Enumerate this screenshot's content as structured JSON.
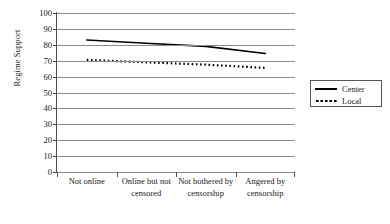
{
  "chart_data": {
    "type": "line",
    "title": "",
    "xlabel": "",
    "ylabel": "Regime Support",
    "ylim": [
      0,
      100
    ],
    "ytick_step": 10,
    "yticks": [
      "100",
      "90",
      "80",
      "70",
      "60",
      "50",
      "40",
      "30",
      "20",
      "10",
      "0"
    ],
    "grid": true,
    "legend_position": "right",
    "categories": [
      "Not online",
      "Online but not censored",
      "Not bothered by censorship",
      "Angered by censorship"
    ],
    "series": [
      {
        "name": "Center",
        "style": "solid",
        "color": "#000000",
        "values": [
          83,
          81,
          79,
          74.5
        ]
      },
      {
        "name": "Local",
        "style": "dotted",
        "color": "#000000",
        "values": [
          70.5,
          69,
          67.5,
          65.5
        ]
      }
    ]
  },
  "legend": {
    "items": [
      {
        "label": "Center",
        "style": "solid"
      },
      {
        "label": "Local",
        "style": "dotted"
      }
    ]
  }
}
